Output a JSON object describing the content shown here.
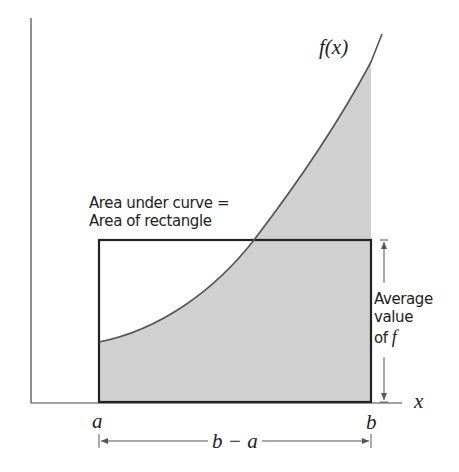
{
  "diagram": {
    "function_label": "f(x)",
    "x_axis_label": "x",
    "left_bound_label": "a",
    "right_bound_label": "b",
    "width_label": "b − a",
    "area_annotation": {
      "line1": "Area under curve =",
      "line2": "Area of rectangle"
    },
    "height_annotation": {
      "line1": "Average",
      "line2": "value",
      "line3_prefix": "of",
      "line3_symbol": "f"
    },
    "colors": {
      "shading": "#d0d0d0",
      "lines": "#222222",
      "curve": "#555555"
    }
  }
}
